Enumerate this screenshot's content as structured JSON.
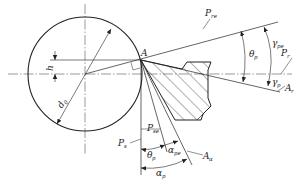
{
  "figure": {
    "type": "cutting-tool geometry diagram",
    "colors": {
      "line": "#222222",
      "background": "#ffffff"
    }
  },
  "labels": {
    "point_A": "A",
    "h": "h",
    "d0": "d",
    "d0_sub": "0",
    "P_re": "P",
    "P_re_sub": "re",
    "P_r": "P",
    "P_r_sub": "r",
    "A_r": "A",
    "A_r_sub": "r",
    "P_se": "P",
    "P_se_sub": "se",
    "P_s": "P",
    "P_s_sub": "s",
    "A_a": "A",
    "A_a_sub": "α",
    "theta_p_right": "θ",
    "theta_p_right_sub": "p",
    "gamma_pe": "γ",
    "gamma_pe_sub": "pe",
    "gamma_p": "γ",
    "gamma_p_sub": "p",
    "theta_p_bottom": "θ",
    "theta_p_bottom_sub": "p",
    "alpha_pe": "α",
    "alpha_pe_sub": "pe",
    "alpha_p": "α",
    "alpha_p_sub": "p"
  }
}
